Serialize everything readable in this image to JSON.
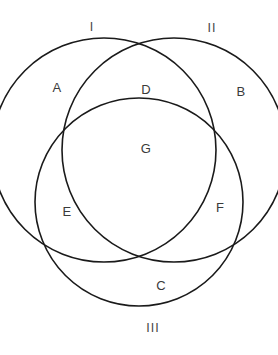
{
  "diagram": {
    "type": "venn-diagram",
    "background_color": "#ffffff",
    "stroke_color": "#1a1a1a",
    "label_color": "#3d3d3d",
    "circle_labels": [
      {
        "id": "I",
        "text": "I",
        "x": 92,
        "y": 27
      },
      {
        "id": "II",
        "text": "II",
        "x": 212,
        "y": 28
      },
      {
        "id": "III",
        "text": "III",
        "x": 153,
        "y": 328
      }
    ],
    "region_labels": [
      {
        "id": "A",
        "text": "A",
        "x": 57,
        "y": 87
      },
      {
        "id": "B",
        "text": "B",
        "x": 241,
        "y": 91
      },
      {
        "id": "C",
        "text": "C",
        "x": 161,
        "y": 285
      },
      {
        "id": "D",
        "text": "D",
        "x": 146,
        "y": 89
      },
      {
        "id": "E",
        "text": "E",
        "x": 67,
        "y": 211
      },
      {
        "id": "F",
        "text": "F",
        "x": 220,
        "y": 207
      },
      {
        "id": "G",
        "text": "G",
        "x": 146,
        "y": 148
      }
    ],
    "circles": [
      {
        "id": "I",
        "cx": 104,
        "cy": 150,
        "r": 112
      },
      {
        "id": "II",
        "cx": 174,
        "cy": 150,
        "r": 112
      },
      {
        "id": "III",
        "cx": 139,
        "cy": 202,
        "r": 104
      }
    ]
  }
}
